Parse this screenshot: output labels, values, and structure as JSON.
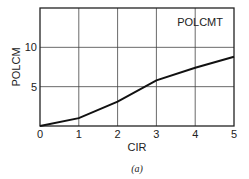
{
  "chart_data": {
    "type": "line",
    "title": "",
    "annotation": "POLCMT",
    "xlabel": "CIR",
    "ylabel": "POLCM",
    "caption": "(a)",
    "x": [
      0,
      1,
      2,
      3,
      4,
      5
    ],
    "series": [
      {
        "name": "POLCMT",
        "values": [
          0,
          1,
          3.1,
          5.8,
          7.4,
          8.8
        ]
      }
    ],
    "xlim": [
      0,
      5
    ],
    "ylim": [
      0,
      15
    ],
    "xticks": [
      "0",
      "1",
      "2",
      "3",
      "4",
      "5"
    ],
    "yticks": [
      "5",
      "10"
    ],
    "grid": true,
    "legend": "none"
  }
}
